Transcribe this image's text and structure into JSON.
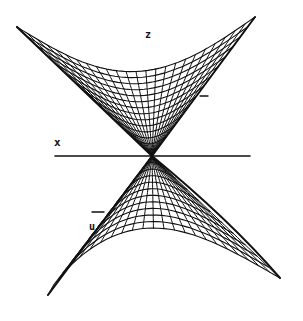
{
  "figure": {
    "axis_labels": {
      "x": "x",
      "z": "z",
      "u": "u"
    },
    "colors": {
      "ink": "#111111",
      "background": "#ffffff"
    },
    "geometry": {
      "apex": [
        152,
        156
      ],
      "axis_line": {
        "x1": 55,
        "x2": 250,
        "y": 156
      },
      "upper_surface": {
        "left_rim": [
          [
            17,
            27
          ],
          [
            152,
            156
          ]
        ],
        "right_rim": [
          [
            255,
            17
          ],
          [
            152,
            156
          ]
        ],
        "top_edge_y": 17
      },
      "lower_surface": {
        "left_rim": [
          [
            152,
            156
          ],
          [
            48,
            295
          ]
        ],
        "right_rim": [
          [
            152,
            156
          ],
          [
            280,
            278
          ]
        ],
        "bottom_edge_y": 295
      }
    }
  }
}
